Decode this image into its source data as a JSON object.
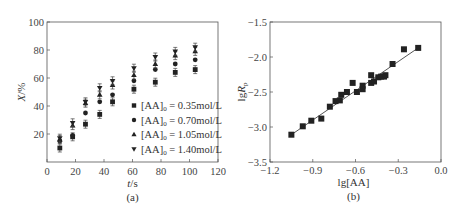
{
  "chart_data": [
    {
      "type": "scatter",
      "panel_label": "(a)",
      "title": "",
      "xlabel": "t/s",
      "ylabel": "X/%",
      "xlim": [
        0,
        120
      ],
      "ylim": [
        0,
        100
      ],
      "xticks": [
        0,
        20,
        40,
        60,
        80,
        100,
        120
      ],
      "yticks": [
        20,
        40,
        60,
        80,
        100
      ],
      "grid": false,
      "legend_position": "lower right",
      "x": [
        9,
        18,
        27,
        37,
        46,
        61,
        76,
        90,
        104
      ],
      "series": [
        {
          "name": "[AA]0 = 0.35mol/L",
          "legend_label": "[AA]",
          "sub": "0",
          "conc": " = 0.35mol/L",
          "marker": "square",
          "values": [
            10,
            18,
            27,
            34,
            43,
            52,
            57,
            64,
            66
          ]
        },
        {
          "name": "[AA]0 = 0.70mol/L",
          "legend_label": "[AA]",
          "sub": "0",
          "conc": " = 0.70mol/L",
          "marker": "circle",
          "values": [
            15,
            19,
            35,
            43,
            48,
            58,
            66,
            70,
            73
          ]
        },
        {
          "name": "[AA]0 = 1.05mol/L",
          "legend_label": "[AA]",
          "sub": "0",
          "conc": " = 1.05mol/L",
          "marker": "triangle-up",
          "values": [
            16,
            26,
            42,
            48,
            55,
            62,
            70,
            76,
            79
          ]
        },
        {
          "name": "[AA]0 = 1.40mol/L",
          "legend_label": "[AA]",
          "sub": "0",
          "conc": " = 1.40mol/L",
          "marker": "triangle-down",
          "values": [
            17,
            28,
            43,
            53,
            58,
            67,
            75,
            79,
            82
          ]
        }
      ]
    },
    {
      "type": "scatter",
      "panel_label": "(b)",
      "title": "",
      "xlabel": "lg[AA]",
      "ylabel": "lgRp",
      "xlim": [
        -1.2,
        0.0
      ],
      "ylim": [
        -3.5,
        -1.5
      ],
      "xticks": [
        -1.2,
        -0.9,
        -0.6,
        -0.3,
        0.0
      ],
      "yticks": [
        -3.5,
        -3.0,
        -2.5,
        -2.0,
        -1.5
      ],
      "grid": false,
      "fit_line": {
        "x": [
          -1.05,
          -0.16
        ],
        "y": [
          -3.11,
          -1.87
        ]
      },
      "points": [
        [
          -1.05,
          -3.11
        ],
        [
          -0.97,
          -2.99
        ],
        [
          -0.91,
          -2.91
        ],
        [
          -0.84,
          -2.88
        ],
        [
          -0.78,
          -2.71
        ],
        [
          -0.74,
          -2.63
        ],
        [
          -0.71,
          -2.62
        ],
        [
          -0.7,
          -2.54
        ],
        [
          -0.66,
          -2.5
        ],
        [
          -0.62,
          -2.37
        ],
        [
          -0.59,
          -2.5
        ],
        [
          -0.55,
          -2.41
        ],
        [
          -0.55,
          -2.46
        ],
        [
          -0.49,
          -2.26
        ],
        [
          -0.49,
          -2.37
        ],
        [
          -0.47,
          -2.35
        ],
        [
          -0.44,
          -2.29
        ],
        [
          -0.42,
          -2.28
        ],
        [
          -0.4,
          -2.28
        ],
        [
          -0.39,
          -2.26
        ],
        [
          -0.34,
          -2.1
        ],
        [
          -0.26,
          -1.89
        ],
        [
          -0.16,
          -1.87
        ]
      ]
    }
  ]
}
